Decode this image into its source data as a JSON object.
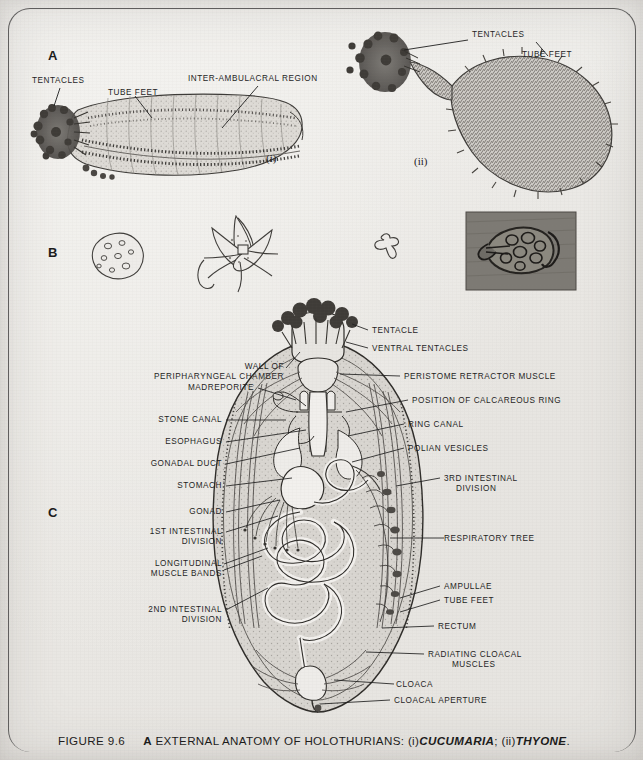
{
  "page": {
    "background_hex": "#eceae6",
    "ink_hex": "#1d1d1d",
    "frame_hex": "#5d5d5d"
  },
  "panels": [
    {
      "id": "A",
      "letter": "A"
    },
    {
      "id": "B",
      "letter": "B"
    },
    {
      "id": "C",
      "letter": "C"
    }
  ],
  "panel_a": {
    "figure_i": {
      "roman": "(i)",
      "species": "CUCUMARIA",
      "labels": [
        {
          "text": "TENTACLES"
        },
        {
          "text": "TUBE FEET"
        },
        {
          "text": "INTER-AMBULACRAL REGION"
        }
      ]
    },
    "figure_ii": {
      "roman": "(ii)",
      "species": "THYONE",
      "labels": [
        {
          "text": "TENTACLES"
        },
        {
          "text": "TUBE FEET"
        }
      ]
    }
  },
  "panel_b": {
    "ossicles": [
      {
        "name": "perforated-plate-ossicle"
      },
      {
        "name": "wheel-ossicle"
      },
      {
        "name": "anchor-plate-ossicle"
      },
      {
        "name": "table-and-anchor-photomicrograph"
      }
    ]
  },
  "panel_c": {
    "labels_left": [
      {
        "text": "WALL OF",
        "text2": "PERIPHARYNGEAL CHAMBER"
      },
      {
        "text": "MADREPORITE"
      },
      {
        "text": "STONE CANAL"
      },
      {
        "text": "ESOPHAGUS"
      },
      {
        "text": "GONADAL DUCT"
      },
      {
        "text": "STOMACH"
      },
      {
        "text": "GONAD"
      },
      {
        "text": "1ST INTESTINAL",
        "text2": "DIVISION"
      },
      {
        "text": "LONGITUDINAL",
        "text2": "MUSCLE BANDS"
      },
      {
        "text": "2ND INTESTINAL",
        "text2": "DIVISION"
      }
    ],
    "labels_right": [
      {
        "text": "TENTACLE"
      },
      {
        "text": "VENTRAL TENTACLES"
      },
      {
        "text": "PERISTOME RETRACTOR MUSCLE"
      },
      {
        "text": "POSITION OF CALCAREOUS RING"
      },
      {
        "text": "RING CANAL"
      },
      {
        "text": "POLIAN VESICLES"
      },
      {
        "text": "3RD INTESTINAL",
        "text2": "DIVISION"
      },
      {
        "text": "RESPIRATORY TREE"
      },
      {
        "text": "AMPULLAE"
      },
      {
        "text": "TUBE FEET"
      },
      {
        "text": "RECTUM"
      },
      {
        "text": "RADIATING CLOACAL",
        "text2": "MUSCLES"
      },
      {
        "text": "CLOACA"
      },
      {
        "text": "CLOACAL APERTURE"
      }
    ]
  },
  "caption": {
    "figure_number": "FIGURE 9.6",
    "panel_tag": "A",
    "title": "EXTERNAL ANATOMY OF HOLOTHURIANS:",
    "item_i": "(i)",
    "species_i": "CUCUMARIA",
    "sep": ";",
    "item_ii": "(ii)",
    "species_ii": "THYONE",
    "period": "."
  }
}
